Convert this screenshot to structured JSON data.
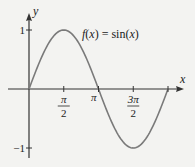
{
  "chart_data": {
    "type": "line",
    "title": "",
    "annotation": "f(x) = sin(x)",
    "annotation_parts": {
      "f": "f",
      "open": "(",
      "x": "x",
      "close": ") = sin(",
      "x2": "x",
      "end": ")"
    },
    "xlabel": "x",
    "ylabel": "y",
    "xlim": [
      0,
      6.2832
    ],
    "ylim": [
      -1,
      1
    ],
    "grid": false,
    "x_ticks": [
      {
        "value": 1.5708,
        "label_num": "π",
        "label_den": "2"
      },
      {
        "value": 3.1416,
        "label": "π"
      },
      {
        "value": 4.7124,
        "label_num": "3π",
        "label_den": "2"
      },
      {
        "value": 6.2832,
        "label": ""
      }
    ],
    "y_ticks": [
      {
        "value": 1,
        "label": "1"
      },
      {
        "value": -1,
        "label": "−1"
      }
    ],
    "series": [
      {
        "name": "f(x) = sin(x)",
        "function": "sin",
        "domain": [
          0,
          6.2832
        ],
        "samples": 120
      }
    ],
    "colors": {
      "curve": "#7a7a7a",
      "axis": "#333333",
      "text": "#222222"
    }
  }
}
